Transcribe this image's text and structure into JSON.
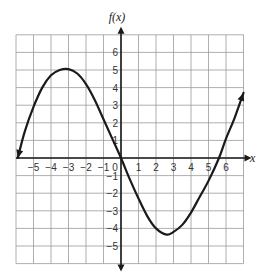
{
  "chart_data": {
    "type": "line",
    "title": "",
    "xlabel": "x",
    "ylabel": "f(x)",
    "xlim": [
      -6,
      7
    ],
    "ylim": [
      -6,
      7
    ],
    "grid": true,
    "x_ticks": [
      -5,
      -4,
      -3,
      -2,
      -1,
      0,
      1,
      2,
      3,
      4,
      5,
      6
    ],
    "y_ticks": [
      -5,
      -4,
      -3,
      -2,
      -1,
      1,
      2,
      3,
      4,
      5,
      6
    ],
    "series": [
      {
        "name": "f(x)",
        "color": "#1a1a1a",
        "arrows_both_ends": true,
        "x": [
          -5.9,
          -5.5,
          -5,
          -4.5,
          -4,
          -3.5,
          -3,
          -2.5,
          -2,
          -1.5,
          -1,
          -0.5,
          0,
          0.5,
          1,
          1.5,
          2,
          2.6,
          3,
          3.5,
          4,
          4.5,
          5,
          5.6,
          6,
          6.5,
          7
        ],
        "values": [
          0,
          1.5,
          2.9,
          4.0,
          4.7,
          5.0,
          5.05,
          4.8,
          4.2,
          3.3,
          2.2,
          1.1,
          0,
          -1.2,
          -2.3,
          -3.3,
          -4.0,
          -4.35,
          -4.2,
          -3.8,
          -3.1,
          -2.2,
          -1.3,
          0,
          1.1,
          2.3,
          3.7
        ]
      }
    ],
    "key_points": {
      "local_max": [
        -3,
        5
      ],
      "local_min": [
        2.6,
        -4.4
      ],
      "x_intercepts": [
        -5.9,
        0,
        5.6
      ],
      "y_intercept": 0
    }
  },
  "axis": {
    "x_label": "x",
    "y_label": "f(x)",
    "origin_label": "0"
  }
}
